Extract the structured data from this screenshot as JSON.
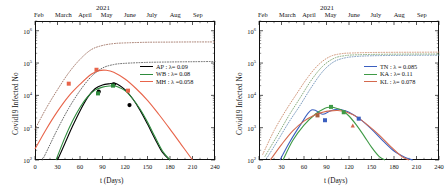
{
  "figure": {
    "year_title": "2021",
    "xlabel": "t (Days)",
    "ylabel": "Covid19 Infected  No",
    "x_ticks": [
      "0",
      "30",
      "60",
      "90",
      "120",
      "150",
      "180",
      "210",
      "240"
    ],
    "y_ticks": [
      "10",
      "10",
      "10",
      "10",
      "10"
    ],
    "y_exponents": [
      "2",
      "3",
      "4",
      "5",
      "6"
    ],
    "months": [
      "Feb",
      "March",
      "April",
      "May",
      "June",
      "July",
      "Aug",
      "Sep"
    ]
  },
  "left_panel": {
    "legend": [
      {
        "label": "AP : λ= 0.09",
        "color": "#000000"
      },
      {
        "label": "WB : λ= 0.08",
        "color": "#2e8b3d"
      },
      {
        "label": "MH : λ =0.058",
        "color": "#e8644a"
      }
    ]
  },
  "right_panel": {
    "legend": [
      {
        "label": "TN : λ = 0.085",
        "color": "#3b5fbf"
      },
      {
        "label": "KA : λ= 0.11",
        "color": "#3f9a46"
      },
      {
        "label": "KL : λ= 0.078",
        "color": "#d4694e"
      }
    ]
  },
  "chart_data": {
    "type": "line",
    "title": "2021",
    "xlabel": "t (Days)",
    "ylabel": "Covid19 Infected No",
    "xlim": [
      0,
      240
    ],
    "ylim": [
      100,
      2000000
    ],
    "yscale": "log",
    "xticks": [
      0,
      30,
      60,
      90,
      120,
      150,
      180,
      210,
      240
    ],
    "yticks": [
      100,
      1000,
      10000,
      100000,
      1000000
    ],
    "secondary_xaxis": {
      "label": "2021",
      "ticks": [
        0,
        28,
        59,
        89,
        120,
        150,
        181,
        212
      ],
      "ticklabels": [
        "Feb",
        "March",
        "April",
        "May",
        "June",
        "July",
        "Aug",
        "Sep"
      ]
    },
    "grid": false,
    "legend_position": "center right",
    "panels": [
      {
        "name": "left",
        "series": [
          {
            "name": "AP : λ= 0.09",
            "color": "#000000",
            "style": "solid",
            "lambda": 0.09,
            "x": [
              30,
              40,
              50,
              60,
              70,
              80,
              90,
              100,
              105,
              110,
              120,
              130,
              140,
              150,
              160,
              170,
              180
            ],
            "y": [
              100,
              330,
              1100,
              3300,
              8500,
              16000,
              21000,
              23000,
              23500,
              22000,
              15000,
              8000,
              3500,
              1300,
              450,
              170,
              100
            ]
          },
          {
            "name": "WB : λ= 0.08",
            "color": "#2e8b3d",
            "style": "solid",
            "lambda": 0.08,
            "x": [
              28,
              40,
              50,
              60,
              70,
              80,
              90,
              100,
              105,
              110,
              120,
              130,
              140,
              150,
              160,
              170,
              180
            ],
            "y": [
              100,
              500,
              1600,
              4200,
              9000,
              14500,
              18000,
              19500,
              19500,
              18500,
              14000,
              8000,
              3800,
              1500,
              520,
              190,
              100
            ]
          },
          {
            "name": "MH : λ =0.058",
            "color": "#e8644a",
            "style": "solid",
            "lambda": 0.058,
            "x": [
              0,
              15,
              30,
              45,
              60,
              75,
              85,
              95,
              105,
              120,
              135,
              150,
              165,
              180,
              195,
              210
            ],
            "y": [
              220,
              900,
              3200,
              9500,
              22000,
              45000,
              58000,
              60000,
              52000,
              32000,
              16000,
              7000,
              2600,
              900,
              300,
              100
            ]
          },
          {
            "name": "AP cumulative",
            "color": "#555555",
            "style": "dotted",
            "x": [
              10,
              20,
              30,
              45,
              60,
              75,
              90,
              105,
              120,
              150,
              180,
              210,
              240
            ],
            "y": [
              100,
              300,
              900,
              4000,
              14000,
              38000,
              70000,
              90000,
              98000,
              105000,
              108000,
              110000,
              112000
            ]
          },
          {
            "name": "MH cumulative",
            "color": "#9a6a5a",
            "style": "dotted",
            "x": [
              0,
              15,
              30,
              45,
              60,
              75,
              90,
              105,
              120,
              150,
              180,
              210,
              240
            ],
            "y": [
              900,
              4000,
              15000,
              50000,
              130000,
              260000,
              350000,
              400000,
              420000,
              440000,
              445000,
              450000,
              450000
            ]
          }
        ],
        "markers": [
          {
            "series": "MH",
            "x": 45,
            "y": 23000,
            "shape": "square",
            "color": "#e8644a"
          },
          {
            "series": "MH",
            "x": 82,
            "y": 62000,
            "shape": "square",
            "color": "#e8644a"
          },
          {
            "series": "MH",
            "x": 124,
            "y": 14000,
            "shape": "square",
            "color": "#e8644a"
          },
          {
            "series": "AP",
            "x": 85,
            "y": 13000,
            "shape": "circle",
            "color": "#000000"
          },
          {
            "series": "AP",
            "x": 105,
            "y": 22000,
            "shape": "circle",
            "color": "#000000"
          },
          {
            "series": "AP",
            "x": 126,
            "y": 5000,
            "shape": "circle",
            "color": "#000000"
          },
          {
            "series": "WB",
            "x": 84,
            "y": 11500,
            "shape": "square",
            "color": "#2e8b3d"
          },
          {
            "series": "WB",
            "x": 104,
            "y": 20000,
            "shape": "square",
            "color": "#2e8b3d"
          }
        ]
      },
      {
        "name": "right",
        "series": [
          {
            "name": "TN : λ = 0.085",
            "color": "#3b5fbf",
            "style": "solid",
            "lambda": 0.085,
            "x": [
              28,
              40,
              55,
              70,
              85,
              95,
              105,
              110,
              120,
              135,
              150,
              165,
              180,
              195,
              205
            ],
            "y": [
              100,
              330,
              1200,
              3500,
              2600,
              3300,
              3700,
              3600,
              3000,
              1800,
              900,
              400,
              190,
              120,
              100
            ]
          },
          {
            "name": "KA : λ= 0.11",
            "color": "#3f9a46",
            "style": "solid",
            "lambda": 0.11,
            "x": [
              32,
              45,
              60,
              75,
              88,
              95,
              100,
              110,
              120,
              130,
              140,
              150,
              160,
              168
            ],
            "y": [
              100,
              400,
              1200,
              2600,
              4000,
              4300,
              4200,
              3500,
              2300,
              1200,
              560,
              250,
              130,
              100
            ]
          },
          {
            "name": "KL : λ= 0.078",
            "color": "#d4694e",
            "style": "solid",
            "lambda": 0.078,
            "x": [
              15,
              30,
              45,
              60,
              75,
              85,
              95,
              105,
              115,
              130,
              145,
              160,
              175,
              190,
              200
            ],
            "y": [
              100,
              300,
              800,
              1600,
              2500,
              3000,
              3300,
              3400,
              3100,
              2200,
              1200,
              600,
              270,
              130,
              100
            ]
          },
          {
            "name": "TN cumulative",
            "color": "#6b8fb5",
            "style": "dotted",
            "x": [
              10,
              25,
              40,
              55,
              70,
              85,
              100,
              115,
              130,
              150,
              180,
              210,
              240
            ],
            "y": [
              110,
              400,
              1500,
              5000,
              18000,
              55000,
              110000,
              145000,
              160000,
              168000,
              172000,
              174000,
              175000
            ]
          },
          {
            "name": "KA cumulative",
            "color": "#7aa36f",
            "style": "dotted",
            "x": [
              8,
              25,
              40,
              55,
              70,
              85,
              100,
              115,
              130,
              150,
              180,
              210,
              240
            ],
            "y": [
              130,
              600,
              2400,
              8500,
              30000,
              80000,
              140000,
              170000,
              180000,
              185000,
              188000,
              190000,
              190000
            ]
          },
          {
            "name": "KL cumulative",
            "color": "#c98a6a",
            "style": "dotted",
            "x": [
              5,
              20,
              35,
              50,
              65,
              80,
              95,
              110,
              125,
              150,
              180,
              210,
              240
            ],
            "y": [
              150,
              800,
              3200,
              11000,
              36000,
              92000,
              160000,
              195000,
              205000,
              212000,
              215000,
              216000,
              218000
            ]
          }
        ],
        "markers": [
          {
            "series": "KL",
            "x": 78,
            "y": 2400,
            "shape": "square",
            "color": "#a9603f"
          },
          {
            "series": "TN",
            "x": 88,
            "y": 1700,
            "shape": "square",
            "color": "#3b5fbf"
          },
          {
            "series": "KA",
            "x": 96,
            "y": 4400,
            "shape": "square",
            "color": "#3f9a46"
          },
          {
            "series": "KA",
            "x": 113,
            "y": 3000,
            "shape": "square",
            "color": "#3f9a46"
          },
          {
            "series": "TN",
            "x": 133,
            "y": 1900,
            "shape": "square",
            "color": "#3b5fbf"
          },
          {
            "series": "KL",
            "x": 125,
            "y": 1150,
            "shape": "triangle",
            "color": "#d4694e"
          }
        ]
      }
    ]
  }
}
